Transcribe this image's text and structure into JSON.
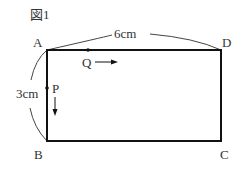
{
  "figure": {
    "title": "図1",
    "vertices": {
      "A": "A",
      "B": "B",
      "C": "C",
      "D": "D"
    },
    "points": {
      "P": "P",
      "Q": "Q"
    },
    "dimensions": {
      "width": "6cm",
      "height": "3cm"
    },
    "colors": {
      "stroke": "#111111",
      "text": "#333333"
    }
  }
}
